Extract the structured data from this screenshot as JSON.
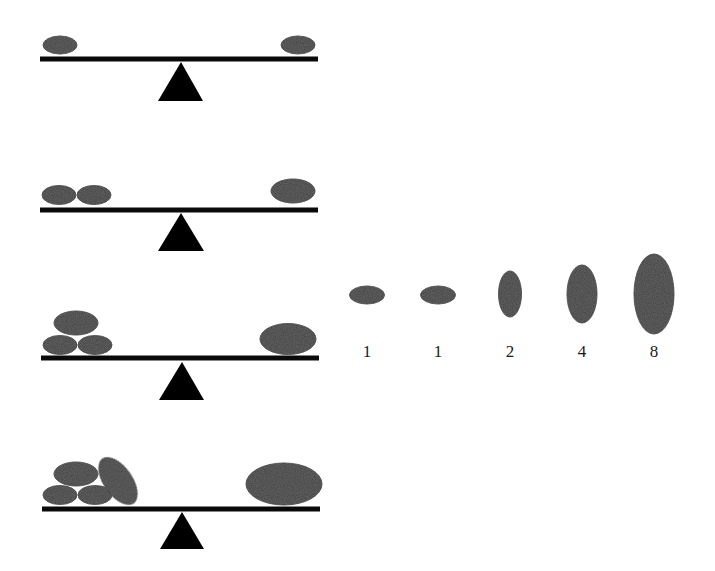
{
  "colors": {
    "stone": "#3f3f3f",
    "stone_edge": "#2e2e2e",
    "beam": "#0a0a0a",
    "fulcrum": "#000000",
    "label": "#1a1a1a",
    "background": "#ffffff"
  },
  "balances": [
    {
      "id": "balance-1",
      "beam": {
        "x1": 40,
        "x2": 318,
        "y": 59,
        "thickness": 5
      },
      "fulcrum": {
        "apex_x": 181,
        "apex_y": 62,
        "base_y": 101,
        "base_x1": 158,
        "base_x2": 203
      },
      "left_stones": [
        {
          "cx": 60,
          "cy": 45,
          "rx": 17,
          "ry": 9,
          "rotate": 0
        }
      ],
      "right_stones": [
        {
          "cx": 298,
          "cy": 45,
          "rx": 17,
          "ry": 9,
          "rotate": 0
        }
      ],
      "left_count": 1,
      "right_weight": 1
    },
    {
      "id": "balance-2",
      "beam": {
        "x1": 40,
        "x2": 318,
        "y": 210,
        "thickness": 5
      },
      "fulcrum": {
        "apex_x": 181,
        "apex_y": 213,
        "base_y": 251,
        "base_x1": 158,
        "base_x2": 204
      },
      "left_stones": [
        {
          "cx": 59,
          "cy": 195,
          "rx": 17,
          "ry": 9.5,
          "rotate": 0
        },
        {
          "cx": 94,
          "cy": 195,
          "rx": 17,
          "ry": 9.5,
          "rotate": 0
        }
      ],
      "right_stones": [
        {
          "cx": 293,
          "cy": 191,
          "rx": 22,
          "ry": 12,
          "rotate": 0
        }
      ],
      "left_count": 2,
      "right_weight": 2
    },
    {
      "id": "balance-3",
      "beam": {
        "x1": 41,
        "x2": 319,
        "y": 358,
        "thickness": 5
      },
      "fulcrum": {
        "apex_x": 182,
        "apex_y": 362,
        "base_y": 400,
        "base_x1": 159,
        "base_x2": 204
      },
      "left_stones": [
        {
          "cx": 76,
          "cy": 323,
          "rx": 22,
          "ry": 12,
          "rotate": 0
        },
        {
          "cx": 60,
          "cy": 345,
          "rx": 17,
          "ry": 9.5,
          "rotate": 0
        },
        {
          "cx": 95,
          "cy": 345,
          "rx": 17,
          "ry": 9.5,
          "rotate": 0
        }
      ],
      "right_stones": [
        {
          "cx": 288,
          "cy": 339,
          "rx": 28,
          "ry": 15.5,
          "rotate": 0
        }
      ],
      "left_count": 3,
      "right_weight": 3
    },
    {
      "id": "balance-4",
      "beam": {
        "x1": 42,
        "x2": 320,
        "y": 509,
        "thickness": 5
      },
      "fulcrum": {
        "apex_x": 182,
        "apex_y": 512,
        "base_y": 549,
        "base_x1": 160,
        "base_x2": 204
      },
      "left_stones": [
        {
          "cx": 76,
          "cy": 474,
          "rx": 22,
          "ry": 12,
          "rotate": 0
        },
        {
          "cx": 60,
          "cy": 495,
          "rx": 17,
          "ry": 9.5,
          "rotate": 0
        },
        {
          "cx": 95,
          "cy": 495,
          "rx": 17,
          "ry": 9.5,
          "rotate": 0
        },
        {
          "cx": 118,
          "cy": 481,
          "rx": 14,
          "ry": 27,
          "rotate": -35
        }
      ],
      "right_stones": [
        {
          "cx": 284,
          "cy": 484,
          "rx": 38,
          "ry": 21,
          "rotate": 0
        }
      ],
      "left_count": 4,
      "right_weight": 4
    }
  ],
  "weight_sequence": {
    "label_y": 343,
    "items": [
      {
        "label": "1",
        "cx": 367,
        "cy": 295,
        "rx": 17.5,
        "ry": 9
      },
      {
        "label": "1",
        "cx": 438,
        "cy": 295,
        "rx": 17.5,
        "ry": 9
      },
      {
        "label": "2",
        "cx": 510,
        "cy": 294,
        "rx": 11.5,
        "ry": 23
      },
      {
        "label": "4",
        "cx": 582,
        "cy": 294,
        "rx": 15,
        "ry": 29
      },
      {
        "label": "8",
        "cx": 654,
        "cy": 294,
        "rx": 20,
        "ry": 40
      }
    ]
  }
}
